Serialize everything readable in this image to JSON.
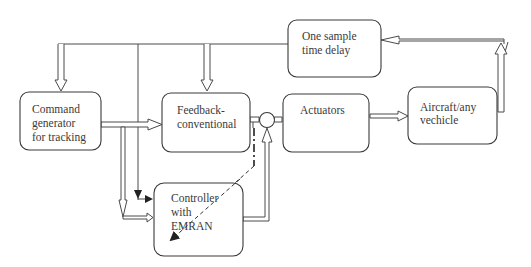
{
  "diagram": {
    "title": "",
    "blocks": {
      "command_generator": {
        "line1": "Command",
        "line2": "generator",
        "line3": "for tracking"
      },
      "feedback": {
        "line1": "Feedback-",
        "line2": "conventional"
      },
      "actuators": {
        "line1": "Actuators"
      },
      "aircraft": {
        "line1": "Aircraft/any",
        "line2": "vechicle"
      },
      "delay": {
        "line1": "One sample",
        "line2": "time delay"
      },
      "controller": {
        "line1": "Controller",
        "line2": "with",
        "line3": "EMRAN"
      }
    },
    "summing_junction": {
      "label": ""
    },
    "connections": [
      {
        "from": "aircraft",
        "to": "delay",
        "style": "double-arrow"
      },
      {
        "from": "delay",
        "to": "feedback-bus",
        "style": "line"
      },
      {
        "from": "feedback-bus",
        "to": "command_generator",
        "style": "double-arrow"
      },
      {
        "from": "feedback-bus",
        "to": "feedback",
        "style": "double-arrow"
      },
      {
        "from": "feedback-bus",
        "to": "controller",
        "style": "solid-arrow"
      },
      {
        "from": "command_generator",
        "to": "feedback",
        "style": "double-arrow"
      },
      {
        "from": "command_generator",
        "to": "controller",
        "style": "double-arrow"
      },
      {
        "from": "feedback",
        "to": "summing_junction",
        "style": "double-line"
      },
      {
        "from": "controller",
        "to": "summing_junction",
        "style": "double-arrow"
      },
      {
        "from": "summing_junction",
        "to": "actuators",
        "style": "double-line"
      },
      {
        "from": "actuators",
        "to": "aircraft",
        "style": "double-arrow"
      },
      {
        "from": "summing_junction",
        "to": "controller",
        "style": "dashed-adaptation-arrow"
      }
    ]
  }
}
